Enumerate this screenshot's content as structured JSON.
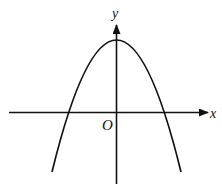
{
  "diagram": {
    "type": "coordinate-plot",
    "labels": {
      "y_axis": "y",
      "x_axis": "x",
      "origin": "O"
    },
    "curve": {
      "kind": "parabola",
      "opens": "down",
      "vertex": "on positive y-axis",
      "x_intercepts": 2
    },
    "colors": {
      "stroke": "#111111",
      "background": "#ffffff"
    }
  }
}
